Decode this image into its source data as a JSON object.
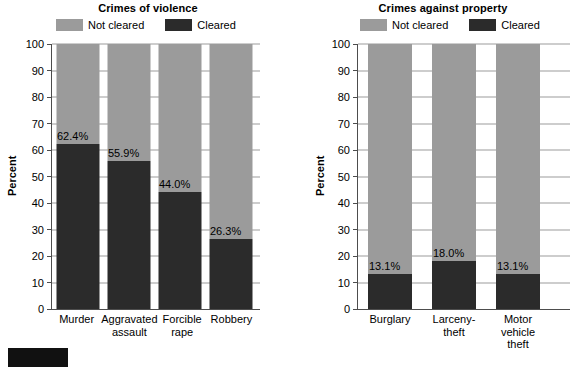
{
  "legend": {
    "not_cleared_label": "Not cleared",
    "cleared_label": "Cleared",
    "not_cleared_color": "#9b9b9b",
    "cleared_color": "#2b2b2b"
  },
  "axis": {
    "y_title": "Percent",
    "y_ticks": [
      "100",
      "90",
      "80",
      "70",
      "60",
      "50",
      "40",
      "30",
      "20",
      "10",
      "0"
    ]
  },
  "chart_data": [
    {
      "type": "bar",
      "title": "Crimes of violence",
      "xlabel": "",
      "ylabel": "Percent",
      "ylim": [
        0,
        100
      ],
      "grid": true,
      "legend_position": "top",
      "stacked": true,
      "categories": [
        "Murder",
        "Aggravated\nassault",
        "Forcible\nrape",
        "Robbery"
      ],
      "series": [
        {
          "name": "Cleared",
          "values": [
            62.4,
            55.9,
            44.0,
            26.3
          ],
          "color": "#2b2b2b"
        },
        {
          "name": "Not cleared",
          "values": [
            37.6,
            44.1,
            56.0,
            73.7
          ],
          "color": "#9b9b9b"
        }
      ],
      "data_labels": [
        "62.4%",
        "55.9%",
        "44.0%",
        "26.3%"
      ]
    },
    {
      "type": "bar",
      "title": "Crimes against property",
      "xlabel": "",
      "ylabel": "Percent",
      "ylim": [
        0,
        100
      ],
      "grid": true,
      "legend_position": "top",
      "stacked": true,
      "categories": [
        "Burglary",
        "Larceny-theft",
        "Motor vehicle\ntheft"
      ],
      "series": [
        {
          "name": "Cleared",
          "values": [
            13.1,
            18.0,
            13.1
          ],
          "color": "#2b2b2b"
        },
        {
          "name": "Not cleared",
          "values": [
            86.9,
            82.0,
            86.9
          ],
          "color": "#9b9b9b"
        }
      ],
      "data_labels": [
        "13.1%",
        "18.0%",
        "13.1%"
      ]
    }
  ]
}
